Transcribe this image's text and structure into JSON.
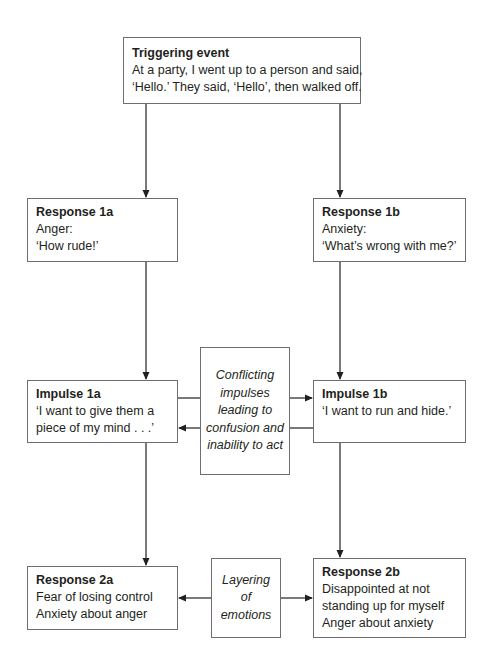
{
  "diagram": {
    "trigger": {
      "title": "Triggering event",
      "lines": [
        "At a party, I went up to a person and said,",
        "‘Hello.’ They said, ‘Hello’, then walked off."
      ]
    },
    "response_1a": {
      "title": "Response 1a",
      "lines": [
        "Anger:",
        "‘How rude!’"
      ]
    },
    "response_1b": {
      "title": "Response 1b",
      "lines": [
        "Anxiety:",
        "‘What’s wrong with me?’"
      ]
    },
    "impulse_1a": {
      "title": "Impulse 1a",
      "lines": [
        "‘I want to give them a",
        "piece of my mind . . .’"
      ]
    },
    "impulse_1b": {
      "title": "Impulse 1b",
      "lines": [
        "‘I want to run and hide.’"
      ]
    },
    "conflict_note": {
      "lines": [
        "Conflicting",
        "impulses",
        "leading to",
        "confusion and",
        "inability to act"
      ]
    },
    "response_2a": {
      "title": "Response 2a",
      "lines": [
        "Fear of losing control",
        "Anxiety about anger"
      ]
    },
    "response_2b": {
      "title": "Response 2b",
      "lines": [
        "Disappointed at not",
        "standing up for myself",
        "Anger about anxiety"
      ]
    },
    "layering_note": {
      "lines": [
        "Layering",
        "of",
        "emotions"
      ]
    },
    "colors": {
      "line": "#231f20",
      "border": "#6d6e71",
      "text": "#231f20"
    }
  }
}
